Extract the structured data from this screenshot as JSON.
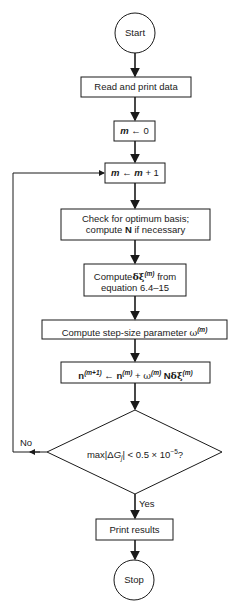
{
  "flowchart": {
    "start": {
      "label": "Start"
    },
    "read": {
      "label": "Read and print data"
    },
    "init": {
      "var": "m",
      "arrow": "←",
      "value": "0"
    },
    "increment": {
      "var": "m",
      "arrow": "←",
      "rhs_var": "m",
      "rhs_rest": " + 1"
    },
    "check": {
      "line1": "Check for optimum basis;",
      "line2_pre": "compute ",
      "line2_bold": "N",
      "line2_post": " if necessary"
    },
    "compute_delta": {
      "pre": "Compute",
      "symbol": "δξ",
      "sup": "(m)",
      "post": " from",
      "line2": "equation 6.4–15"
    },
    "step_size": {
      "pre": "Compute step-size parameter ",
      "symbol": "ω",
      "sup": "(m)"
    },
    "update": {
      "n1": "n",
      "n1_sup": "(m+1)",
      "arrow": " ← ",
      "n2": "n",
      "n2_sup": "(m)",
      "plus": " + ",
      "w": "ω",
      "w_sup": "(m)",
      "N": " N",
      "dxi": "δξ",
      "dxi_sup": "(m)"
    },
    "decision": {
      "pre": "max|Δ",
      "G": "G",
      "sub": "j",
      "post": "| < 0.5 × 10",
      "exp": "−5",
      "q": "?"
    },
    "no_label": "No",
    "yes_label": "Yes",
    "print": {
      "label": "Print results"
    },
    "stop": {
      "label": "Stop"
    }
  },
  "colors": {
    "stroke": "#1a1a1a",
    "background": "#ffffff"
  }
}
